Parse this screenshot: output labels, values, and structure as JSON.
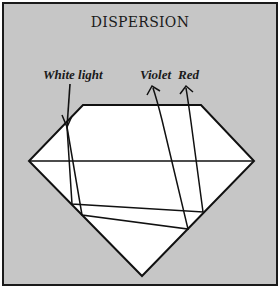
{
  "title": "DISPERSION",
  "labels": {
    "white_light": "White light",
    "violet": "Violet",
    "red": "Red"
  },
  "colors": {
    "background": "#c6c6c6",
    "diamond_fill": "#ffffff",
    "stroke": "#111111",
    "frame_border": "#1a1a1a"
  },
  "diamond": {
    "table": [
      [
        83,
        105
      ],
      [
        201,
        105
      ]
    ],
    "girdle": [
      [
        29,
        161
      ],
      [
        254,
        161
      ]
    ],
    "culet": [
      142,
      276
    ]
  },
  "rays": {
    "incoming": [
      [
        70,
        84
      ],
      [
        67,
        127
      ]
    ],
    "internal_a": [
      [
        67,
        127
      ],
      [
        72,
        204
      ],
      [
        203,
        212
      ],
      [
        188,
        92
      ]
    ],
    "internal_b": [
      [
        67,
        127
      ],
      [
        82,
        215
      ],
      [
        188,
        229
      ],
      [
        158,
        92
      ]
    ]
  }
}
